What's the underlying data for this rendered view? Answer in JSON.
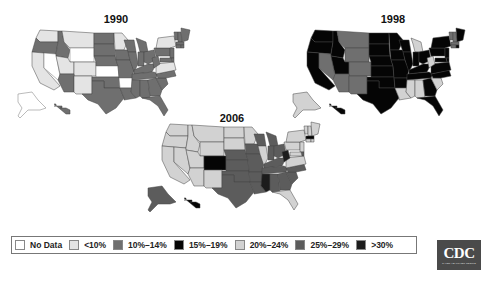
{
  "colors": {
    "no_data": "#ffffff",
    "lt10": "#e4e4e4",
    "10_14": "#6f6f6f",
    "15_19": "#050505",
    "20_24": "#d2d2d2",
    "25_29": "#5c5c5c",
    "gt30": "#1c1c1c"
  },
  "legend": {
    "items": [
      {
        "key": "no_data",
        "label": "No Data"
      },
      {
        "key": "lt10",
        "label": "<10%"
      },
      {
        "key": "10_14",
        "label": "10%–14%"
      },
      {
        "key": "15_19",
        "label": "15%–19%"
      },
      {
        "key": "20_24",
        "label": "20%–24%"
      },
      {
        "key": "25_29",
        "label": "25%–29%"
      },
      {
        "key": "gt30",
        "label": ">30%"
      }
    ]
  },
  "logo": {
    "text": "CDC",
    "subtext": "SAFER·HEALTHIER·PEOPLE"
  },
  "chart_data": {
    "type": "choropleth",
    "legend_position": "bottom",
    "categories": [
      "No Data",
      "<10%",
      "10%–14%",
      "15%–19%",
      "20%–24%",
      "25%–29%",
      ">30%"
    ],
    "maps": [
      {
        "year": "1990",
        "summary": "Mostly 10%–14%; western/plains states <10%; several No Data (WY, NV, KS, AR, AK)",
        "states": {
          "WA": "lt10",
          "OR": "10_14",
          "CA": "lt10",
          "NV": "no_data",
          "ID": "10_14",
          "MT": "lt10",
          "WY": "no_data",
          "UT": "lt10",
          "CO": "lt10",
          "AZ": "10_14",
          "NM": "lt10",
          "ND": "10_14",
          "SD": "10_14",
          "NE": "10_14",
          "KS": "no_data",
          "OK": "10_14",
          "TX": "10_14",
          "MN": "lt10",
          "IA": "10_14",
          "MO": "10_14",
          "AR": "no_data",
          "LA": "10_14",
          "WI": "10_14",
          "IL": "10_14",
          "MI": "10_14",
          "IN": "10_14",
          "OH": "10_14",
          "KY": "10_14",
          "TN": "10_14",
          "MS": "10_14",
          "AL": "10_14",
          "GA": "10_14",
          "FL": "10_14",
          "SC": "10_14",
          "NC": "10_14",
          "VA": "lt10",
          "WV": "10_14",
          "PA": "10_14",
          "NY": "lt10",
          "VT": "10_14",
          "NH": "10_14",
          "ME": "10_14",
          "MA": "10_14",
          "CT": "10_14",
          "RI": "10_14",
          "NJ": "10_14",
          "DE": "10_14",
          "MD": "10_14",
          "AK": "no_data",
          "HI": "10_14"
        }
      },
      {
        "year": "1998",
        "summary": "Mostly 15%–19%; mountain west 10%–14%; several southern states 20%–24%",
        "states": {
          "WA": "15_19",
          "OR": "15_19",
          "CA": "15_19",
          "NV": "10_14",
          "ID": "15_19",
          "MT": "10_14",
          "WY": "10_14",
          "UT": "15_19",
          "CO": "10_14",
          "AZ": "10_14",
          "NM": "10_14",
          "ND": "15_19",
          "SD": "15_19",
          "NE": "15_19",
          "KS": "15_19",
          "OK": "15_19",
          "TX": "15_19",
          "MN": "15_19",
          "IA": "15_19",
          "MO": "15_19",
          "AR": "15_19",
          "LA": "20_24",
          "WI": "15_19",
          "IL": "15_19",
          "MI": "20_24",
          "IN": "15_19",
          "OH": "15_19",
          "KY": "15_19",
          "TN": "15_19",
          "MS": "20_24",
          "AL": "20_24",
          "GA": "15_19",
          "FL": "15_19",
          "SC": "20_24",
          "NC": "15_19",
          "VA": "15_19",
          "WV": "20_24",
          "PA": "15_19",
          "NY": "15_19",
          "VT": "10_14",
          "NH": "10_14",
          "ME": "15_19",
          "MA": "10_14",
          "CT": "10_14",
          "RI": "15_19",
          "NJ": "15_19",
          "DE": "15_19",
          "MD": "15_19",
          "AK": "20_24",
          "HI": "15_19"
        }
      },
      {
        "year": "2006",
        "summary": "West/north 20%–24%; central/south 25%–29%; Colorado 15%–19%; MS, WV >30%",
        "states": {
          "WA": "20_24",
          "OR": "20_24",
          "CA": "20_24",
          "NV": "20_24",
          "ID": "20_24",
          "MT": "20_24",
          "WY": "20_24",
          "UT": "20_24",
          "CO": "15_19",
          "AZ": "20_24",
          "NM": "20_24",
          "ND": "20_24",
          "SD": "20_24",
          "NE": "25_29",
          "KS": "25_29",
          "OK": "25_29",
          "TX": "25_29",
          "MN": "20_24",
          "IA": "25_29",
          "MO": "25_29",
          "AR": "25_29",
          "LA": "25_29",
          "WI": "25_29",
          "IL": "20_24",
          "MI": "25_29",
          "IN": "25_29",
          "OH": "25_29",
          "KY": "25_29",
          "TN": "25_29",
          "MS": "gt30",
          "AL": "25_29",
          "GA": "25_29",
          "FL": "20_24",
          "SC": "25_29",
          "NC": "25_29",
          "VA": "20_24",
          "WV": "gt30",
          "PA": "20_24",
          "NY": "20_24",
          "VT": "20_24",
          "NH": "20_24",
          "ME": "20_24",
          "MA": "15_19",
          "CT": "20_24",
          "RI": "20_24",
          "NJ": "20_24",
          "DE": "25_29",
          "MD": "20_24",
          "AK": "25_29",
          "HI": "15_19"
        }
      }
    ]
  }
}
